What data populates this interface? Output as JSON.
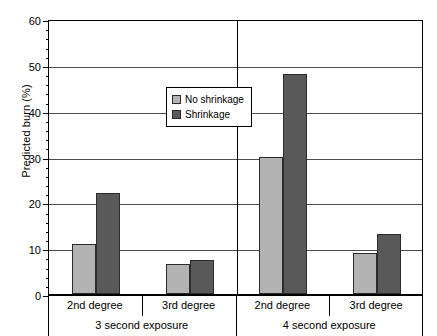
{
  "chart_data": {
    "type": "bar",
    "title": "",
    "xlabel": "",
    "ylabel": "Predicted burn (%)",
    "ylim": [
      0,
      60
    ],
    "ytick_step": 10,
    "yticks": [
      0,
      10,
      20,
      30,
      40,
      50,
      60
    ],
    "grid": true,
    "legend_position": "upper center",
    "categories": [
      "2nd degree",
      "3rd degree",
      "2nd degree",
      "3rd degree"
    ],
    "group_labels": [
      "3 second exposure",
      "4 second exposure"
    ],
    "series": [
      {
        "name": "No shrinkage",
        "color": "#b3b3b3",
        "values": [
          11,
          6.5,
          30,
          9
        ]
      },
      {
        "name": "Shrinkage",
        "color": "#595959",
        "values": [
          22,
          7.5,
          48,
          13
        ]
      }
    ]
  },
  "axes": {
    "y_title": "Predicted burn (%)",
    "y_labels": [
      "60",
      "50",
      "40",
      "30",
      "20",
      "10",
      "0"
    ]
  },
  "legend": {
    "items": [
      {
        "label": "No shrinkage",
        "color": "#b3b3b3"
      },
      {
        "label": "Shrinkage",
        "color": "#595959"
      }
    ]
  },
  "xaxis": {
    "degree_labels": [
      "2nd degree",
      "3rd degree",
      "2nd degree",
      "3rd degree"
    ],
    "exposure_labels": [
      "3 second exposure",
      "4 second exposure"
    ]
  }
}
